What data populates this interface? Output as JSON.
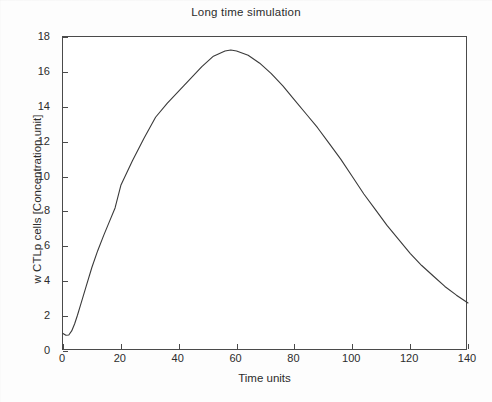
{
  "chart_data": {
    "type": "line",
    "title": "Long time simulation",
    "xlabel": "Time units",
    "ylabel": "w CTLp cells  [Concentration unit]",
    "xlim": [
      0,
      140
    ],
    "ylim": [
      0,
      18
    ],
    "xticks": [
      0,
      20,
      40,
      60,
      80,
      100,
      120,
      140
    ],
    "yticks": [
      0,
      2,
      4,
      6,
      8,
      10,
      12,
      14,
      16,
      18
    ],
    "grid": false,
    "legend": null,
    "line_color": "#3a3a3a",
    "series": [
      {
        "name": "w CTLp cells",
        "x": [
          0,
          1,
          2,
          3,
          4,
          5,
          6,
          8,
          10,
          12,
          14,
          16,
          18,
          20,
          24,
          28,
          32,
          36,
          40,
          44,
          48,
          52,
          56,
          58,
          60,
          64,
          68,
          72,
          76,
          80,
          84,
          88,
          92,
          96,
          100,
          104,
          108,
          112,
          116,
          120,
          124,
          128,
          132,
          136,
          140
        ],
        "values": [
          1.0,
          0.9,
          0.92,
          1.15,
          1.55,
          2.05,
          2.6,
          3.7,
          4.8,
          5.75,
          6.6,
          7.4,
          8.2,
          9.5,
          10.9,
          12.2,
          13.4,
          14.2,
          14.9,
          15.6,
          16.3,
          16.9,
          17.2,
          17.25,
          17.2,
          16.95,
          16.5,
          15.9,
          15.2,
          14.4,
          13.6,
          12.8,
          11.9,
          11.0,
          10.0,
          9.0,
          8.1,
          7.2,
          6.4,
          5.6,
          4.9,
          4.3,
          3.7,
          3.2,
          2.75
        ]
      }
    ]
  },
  "axes": {
    "y_tick_labels": [
      "0",
      "2",
      "4",
      "6",
      "8",
      "10",
      "12",
      "14",
      "16",
      "18"
    ],
    "x_tick_labels": [
      "0",
      "20",
      "40",
      "60",
      "80",
      "100",
      "120",
      "140"
    ]
  }
}
